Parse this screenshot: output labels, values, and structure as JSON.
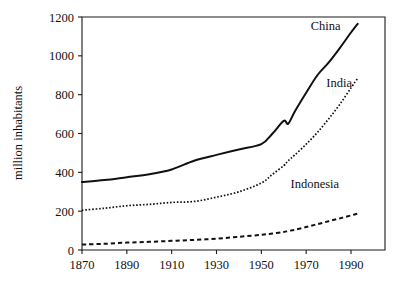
{
  "figure": {
    "background_color": "#ffffff",
    "line_color": "#111111",
    "axis_color": "#1a1a1a"
  },
  "axis": {
    "y_title": "million inhabitants",
    "x_title": "",
    "y_ticks": [
      "0",
      "200",
      "400",
      "600",
      "800",
      "1000",
      "1200"
    ],
    "x_ticks": [
      "1870",
      "1890",
      "1910",
      "1930",
      "1950",
      "1970",
      "1990"
    ]
  },
  "labels": {
    "china": "China",
    "india": "India",
    "indonesia": "Indonesia"
  },
  "chart_data": {
    "type": "line",
    "title": "",
    "xlabel": "",
    "ylabel": "million inhabitants",
    "xlim": [
      1870,
      1995
    ],
    "ylim": [
      0,
      1200
    ],
    "xticks": [
      1870,
      1890,
      1910,
      1930,
      1950,
      1970,
      1990
    ],
    "yticks": [
      0,
      200,
      400,
      600,
      800,
      1000,
      1200
    ],
    "grid": false,
    "legend": "inline-labels-right",
    "x": [
      1870,
      1880,
      1890,
      1900,
      1910,
      1920,
      1930,
      1940,
      1950,
      1955,
      1960,
      1962,
      1965,
      1970,
      1975,
      1980,
      1985,
      1990,
      1993
    ],
    "series": [
      {
        "name": "China",
        "style": "solid",
        "label_position": {
          "x": 1972,
          "y": 1135
        },
        "values": [
          350,
          360,
          375,
          390,
          415,
          460,
          490,
          518,
          545,
          600,
          665,
          650,
          715,
          810,
          900,
          965,
          1040,
          1120,
          1165
        ]
      },
      {
        "name": "India",
        "style": "dotted",
        "label_position": {
          "x": 1979,
          "y": 840
        },
        "values": [
          205,
          215,
          228,
          235,
          245,
          250,
          272,
          300,
          345,
          390,
          435,
          460,
          490,
          545,
          605,
          675,
          750,
          835,
          885
        ]
      },
      {
        "name": "Indonesia",
        "style": "dashed",
        "label_position": {
          "x": 1963,
          "y": 320
        },
        "values": [
          28,
          32,
          38,
          42,
          47,
          52,
          58,
          68,
          78,
          85,
          93,
          98,
          104,
          118,
          133,
          148,
          163,
          178,
          188
        ]
      }
    ]
  }
}
